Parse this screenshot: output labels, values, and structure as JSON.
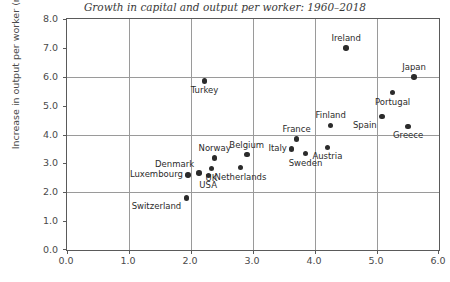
{
  "chart_data": {
    "type": "scatter",
    "title": "Growth in capital and output per worker: 1960–2018",
    "xlabel": "",
    "ylabel": "Increase in output per worker (multiple)",
    "xlim": [
      0.0,
      6.0
    ],
    "ylim": [
      0.0,
      8.0
    ],
    "xticks": [
      "0.0",
      "1.0",
      "2.0",
      "3.0",
      "4.0",
      "5.0",
      "6.0"
    ],
    "xtick_values": [
      0.0,
      1.0,
      2.0,
      3.0,
      4.0,
      5.0,
      6.0
    ],
    "yticks": [
      "0.0",
      "1.0",
      "2.0",
      "3.0",
      "4.0",
      "5.0",
      "6.0",
      "7.0",
      "8.0"
    ],
    "ytick_values": [
      0.0,
      1.0,
      2.0,
      3.0,
      4.0,
      5.0,
      6.0,
      7.0,
      8.0
    ],
    "grid": true,
    "grid_x_values": [
      1.0,
      2.0,
      3.0,
      4.0,
      5.0
    ],
    "grid_y_values": [
      2.0,
      4.0,
      6.0
    ],
    "legend": false,
    "marker_color": "#2b2b2b",
    "points": [
      {
        "label": "Ireland",
        "x": 4.5,
        "y": 7.0,
        "label_pos": "top"
      },
      {
        "label": "Turkey",
        "x": 2.22,
        "y": 5.85,
        "label_pos": "bottom"
      },
      {
        "label": "Japan",
        "x": 5.6,
        "y": 6.0,
        "label_pos": "top"
      },
      {
        "label": "Portugal",
        "x": 5.25,
        "y": 5.45,
        "label_pos": "bottom"
      },
      {
        "label": "Spain",
        "x": 5.08,
        "y": 4.62,
        "label_pos": "bottom-left"
      },
      {
        "label": "Greece",
        "x": 5.5,
        "y": 4.28,
        "label_pos": "bottom"
      },
      {
        "label": "Finland",
        "x": 4.25,
        "y": 4.32,
        "label_pos": "top"
      },
      {
        "label": "France",
        "x": 3.7,
        "y": 3.84,
        "label_pos": "top"
      },
      {
        "label": "Austria",
        "x": 4.2,
        "y": 3.55,
        "label_pos": "bottom"
      },
      {
        "label": "Italy",
        "x": 3.62,
        "y": 3.5,
        "label_pos": "left"
      },
      {
        "label": "Sweden",
        "x": 3.85,
        "y": 3.34,
        "label_pos": "bottom"
      },
      {
        "label": "Belgium",
        "x": 2.9,
        "y": 3.3,
        "label_pos": "top"
      },
      {
        "label": "Norway",
        "x": 2.38,
        "y": 3.18,
        "label_pos": "top"
      },
      {
        "label": "Netherlands",
        "x": 2.8,
        "y": 2.85,
        "label_pos": "bottom"
      },
      {
        "label": "UK",
        "x": 2.33,
        "y": 2.82,
        "label_pos": "bottom"
      },
      {
        "label": "Denmark",
        "x": 2.13,
        "y": 2.66,
        "label_pos": "top-left"
      },
      {
        "label": "USA",
        "x": 2.28,
        "y": 2.58,
        "label_pos": "bottom"
      },
      {
        "label": "Luxembourg",
        "x": 1.95,
        "y": 2.6,
        "label_pos": "left"
      },
      {
        "label": "Switzerland",
        "x": 1.93,
        "y": 1.8,
        "label_pos": "bottom-left"
      }
    ]
  }
}
